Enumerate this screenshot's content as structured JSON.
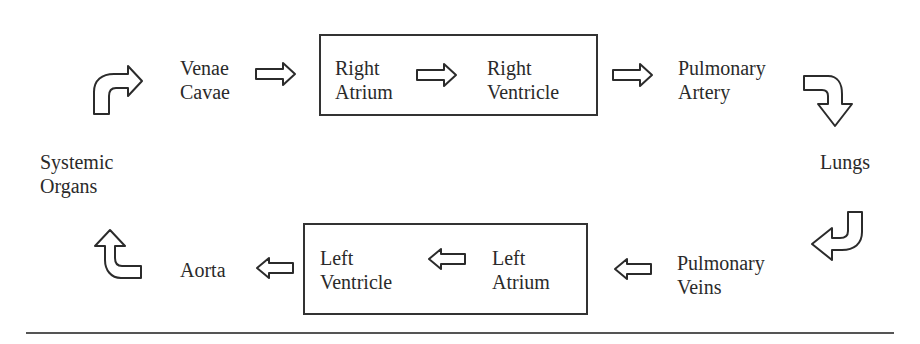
{
  "diagram": {
    "type": "flow",
    "nodes": {
      "venae_cavae": {
        "line1": "Venae",
        "line2": "Cavae"
      },
      "right_atrium": {
        "line1": "Right",
        "line2": "Atrium"
      },
      "right_ventricle": {
        "line1": "Right",
        "line2": "Ventricle"
      },
      "pulmonary_artery": {
        "line1": "Pulmonary",
        "line2": "Artery"
      },
      "lungs": {
        "line1": "Lungs"
      },
      "pulmonary_veins": {
        "line1": "Pulmonary",
        "line2": "Veins"
      },
      "left_atrium": {
        "line1": "Left",
        "line2": "Atrium"
      },
      "left_ventricle": {
        "line1": "Left",
        "line2": "Ventricle"
      },
      "aorta": {
        "line1": "Aorta"
      },
      "systemic_organs": {
        "line1": "Systemic",
        "line2": "Organs"
      }
    },
    "groups": [
      {
        "name": "right-heart-box",
        "contains": [
          "Right Atrium",
          "Right Ventricle"
        ]
      },
      {
        "name": "left-heart-box",
        "contains": [
          "Left Atrium",
          "Left Ventricle"
        ]
      }
    ],
    "edges": [
      {
        "from": "Systemic Organs",
        "to": "Venae Cavae",
        "arrow": "curved-up-right"
      },
      {
        "from": "Venae Cavae",
        "to": "Right Atrium",
        "arrow": "right"
      },
      {
        "from": "Right Atrium",
        "to": "Right Ventricle",
        "arrow": "right"
      },
      {
        "from": "Right Ventricle",
        "to": "Pulmonary Artery",
        "arrow": "right"
      },
      {
        "from": "Pulmonary Artery",
        "to": "Lungs",
        "arrow": "curved-right-down"
      },
      {
        "from": "Lungs",
        "to": "Pulmonary Veins",
        "arrow": "curved-down-left"
      },
      {
        "from": "Pulmonary Veins",
        "to": "Left Atrium",
        "arrow": "left"
      },
      {
        "from": "Left Atrium",
        "to": "Left Ventricle",
        "arrow": "left"
      },
      {
        "from": "Left Ventricle",
        "to": "Aorta",
        "arrow": "left"
      },
      {
        "from": "Aorta",
        "to": "Systemic Organs",
        "arrow": "curved-left-up"
      }
    ],
    "colors": {
      "stroke": "#2b2b2b",
      "text": "#2a2a2a",
      "background": "#ffffff"
    }
  }
}
